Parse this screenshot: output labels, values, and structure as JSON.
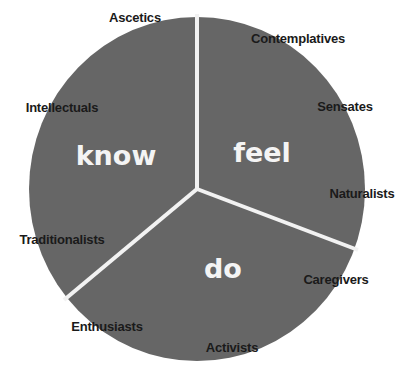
{
  "diagram": {
    "type": "pie-wheel",
    "colors": {
      "segment_fill": "#666666",
      "divider": "#f2f2f2",
      "background": "#ffffff",
      "main_label": "#f4f4f4",
      "sub_label": "#1a1a1a"
    },
    "segments": [
      {
        "label": "know",
        "sub_labels": [
          "Ascetics",
          "Intellectuals",
          "Traditionalists"
        ]
      },
      {
        "label": "feel",
        "sub_labels": [
          "Contemplatives",
          "Sensates",
          "Naturalists"
        ]
      },
      {
        "label": "do",
        "sub_labels": [
          "Caregivers",
          "Activists",
          "Enthusiasts"
        ]
      }
    ]
  },
  "labels": {
    "know": "know",
    "feel": "feel",
    "do": "do",
    "ascetics": "Ascetics",
    "intellectuals": "Intellectuals",
    "traditionalists": "Traditionalists",
    "contemplatives": "Contemplatives",
    "sensates": "Sensates",
    "naturalists": "Naturalists",
    "caregivers": "Caregivers",
    "activists": "Activists",
    "enthusiasts": "Enthusiasts"
  }
}
